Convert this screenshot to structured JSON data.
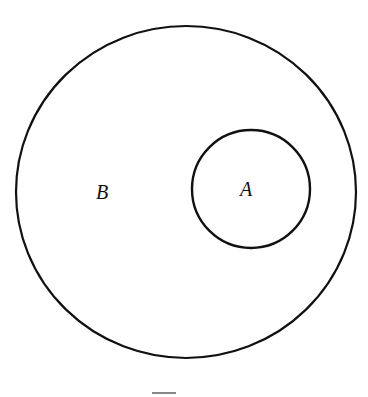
{
  "diagram": {
    "type": "venn-subset",
    "outer_set": {
      "label": "B",
      "cx": 186,
      "cy": 192,
      "rx": 170,
      "ry": 166
    },
    "inner_set": {
      "label": "A",
      "cx": 251,
      "cy": 189,
      "r": 59
    },
    "stroke_color": "#111111",
    "background_color": "#ffffff",
    "relationship": "A ⊂ B"
  }
}
